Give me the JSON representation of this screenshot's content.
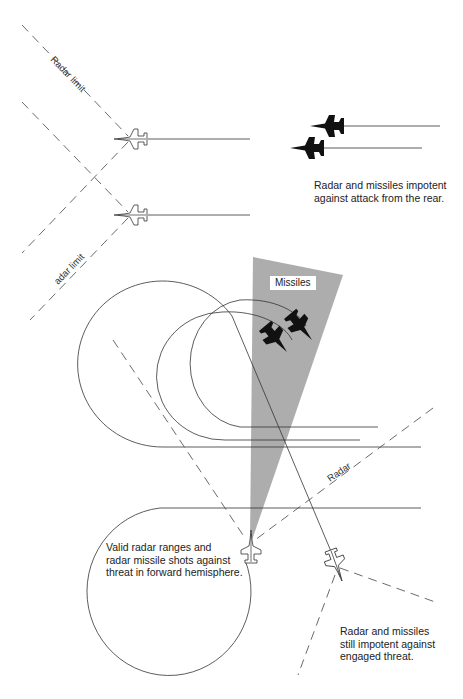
{
  "diagram": {
    "labels": {
      "radar_limit_top": "Radar limit",
      "radar_limit_bottom": "adar limit",
      "missiles": "Missiles",
      "radar": "Radar"
    },
    "captions": {
      "rear_attack": "Radar and missiles impotent\nagainst attack from the rear.",
      "forward_hemisphere": "Valid radar ranges and\nradar missile shots against\nthreat in forward hemisphere.",
      "engaged_threat": "Radar and missiles\nstill impotent against\nengaged threat."
    },
    "colors": {
      "line": "#333333",
      "missile_cone": "#a9a9a9",
      "background": "#ffffff"
    },
    "aircraft": [
      {
        "id": "friendly-1",
        "style": "outline",
        "heading": "left"
      },
      {
        "id": "friendly-2",
        "style": "outline",
        "heading": "left"
      },
      {
        "id": "attacker-1",
        "style": "silhouette",
        "heading": "left"
      },
      {
        "id": "attacker-2",
        "style": "silhouette",
        "heading": "left"
      },
      {
        "id": "missile-target-1",
        "style": "silhouette",
        "heading": "down-right"
      },
      {
        "id": "missile-target-2",
        "style": "silhouette",
        "heading": "down-right"
      },
      {
        "id": "friendly-3",
        "style": "outline",
        "heading": "up"
      },
      {
        "id": "threat",
        "style": "outline",
        "heading": "down-right"
      }
    ]
  }
}
